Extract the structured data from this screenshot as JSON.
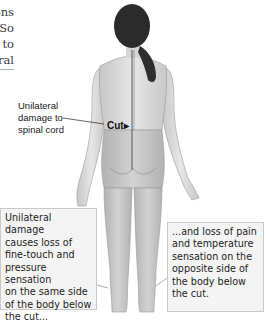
{
  "body_text": {
    "lines": [
      "n",
      "ons",
      "So",
      "to",
      "ral"
    ],
    "underlined_line_index": 4
  },
  "figure": {
    "labels": {
      "damage": [
        "Unilateral",
        "damage to",
        "spinal cord"
      ],
      "cut": "Cut"
    },
    "colors": {
      "skin_upper": "#dcdcdc",
      "skin_lower": "#c4c4c4",
      "hair": "#2b2b2b",
      "spinal_line": "#555555",
      "callout_bg": "#f4f4f4",
      "callout_border": "#c9c9c9"
    }
  },
  "callouts": {
    "left": {
      "lines": [
        "Unilateral damage",
        "causes loss of",
        "fine-touch and",
        "pressure sensation",
        "on the same side",
        "of the body below",
        "the cut..."
      ]
    },
    "right": {
      "lines": [
        "...and loss of pain",
        "and temperature",
        "sensation on the",
        "opposite side of",
        "the body below",
        "the cut."
      ]
    }
  }
}
